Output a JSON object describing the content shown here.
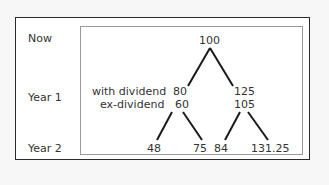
{
  "rows": {
    "now": "Now",
    "year1": "Year 1",
    "year2": "Year 2"
  },
  "annotations": {
    "with_dividend": "with dividend",
    "ex_dividend": "ex-dividend"
  },
  "tree": {
    "root": "100",
    "year1": {
      "down": {
        "with_dividend": "80",
        "ex_dividend": "60"
      },
      "up": {
        "with_dividend": "125",
        "ex_dividend": "105"
      }
    },
    "year2": {
      "down_down": "48",
      "down_up": "75",
      "up_down": "84",
      "up_up": "131.25"
    }
  },
  "colors": {
    "line": "#1a1a1a",
    "frame": "#2a2a2a",
    "inner_border": "#9a9a9a",
    "text": "#333333"
  }
}
